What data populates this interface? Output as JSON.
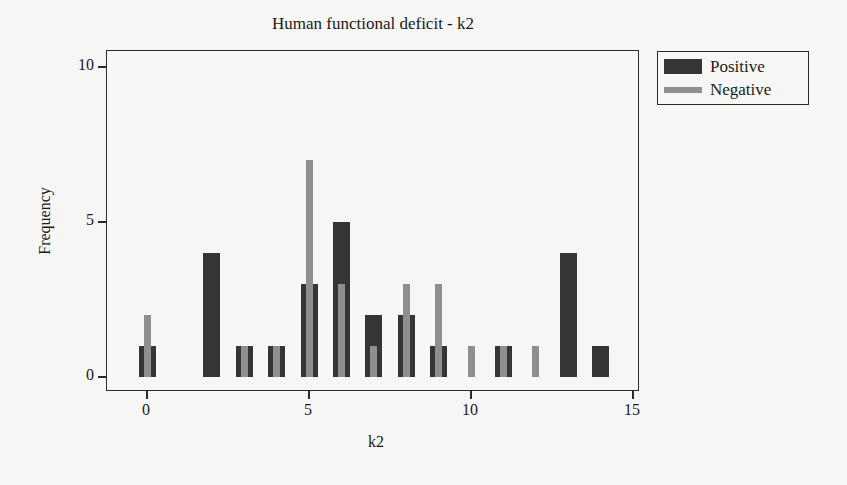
{
  "chart_data": {
    "type": "bar",
    "title": "Human functional deficit - k2",
    "xlabel": "k2",
    "ylabel": "Frequency",
    "xlim": [
      -0.5,
      15.2
    ],
    "ylim": [
      0,
      10
    ],
    "xticks": [
      0,
      5,
      10,
      15
    ],
    "yticks": [
      0,
      5,
      10
    ],
    "grid": false,
    "legend_position": "right-outside-top",
    "categories": [
      0,
      1,
      2,
      3,
      4,
      5,
      6,
      7,
      8,
      9,
      10,
      11,
      12,
      13,
      14
    ],
    "series": [
      {
        "name": "Positive",
        "color": "#353535",
        "values": [
          1,
          0,
          4,
          1,
          1,
          3,
          5,
          2,
          2,
          1,
          0,
          1,
          0,
          4,
          1
        ]
      },
      {
        "name": "Negative",
        "color": "#8f8f8f",
        "values": [
          2,
          0,
          0,
          1,
          1,
          7,
          3,
          1,
          3,
          3,
          1,
          1,
          1,
          0,
          0
        ]
      }
    ]
  },
  "title": "Human functional deficit - k2",
  "axes": {
    "x_label": "k2",
    "y_label": "Frequency",
    "x_ticks": [
      "0",
      "5",
      "10",
      "15"
    ],
    "y_ticks": [
      "0",
      "5",
      "10"
    ]
  },
  "legend": {
    "items": [
      {
        "label": "Positive",
        "color": "#353535"
      },
      {
        "label": "Negative",
        "color": "#8f8f8f"
      }
    ]
  }
}
